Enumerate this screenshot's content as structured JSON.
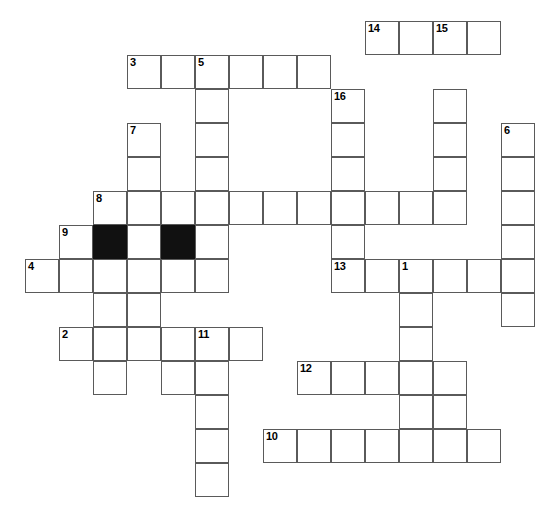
{
  "puzzle": {
    "title": "Crossword Puzzle Grid",
    "type": "crossword-grid",
    "geometry": {
      "cell_size": 34,
      "origin_x": 25,
      "origin_y": 21,
      "columns": 15,
      "rows": 14,
      "width": 555,
      "height": 505
    },
    "colors": {
      "background": "#ffffff",
      "cell_fill": "#ffffff",
      "cell_border": "#5a5a5a",
      "block_fill": "#111111",
      "number_color": "#000000"
    },
    "counts": {
      "open_cells": 97,
      "block_cells": 2,
      "numbered_clues": 16
    },
    "cells": [
      {
        "col": 10,
        "row": 0,
        "number": "14"
      },
      {
        "col": 11,
        "row": 0,
        "number": ""
      },
      {
        "col": 12,
        "row": 0,
        "number": "15"
      },
      {
        "col": 13,
        "row": 0,
        "number": ""
      },
      {
        "col": 3,
        "row": 1,
        "number": "3"
      },
      {
        "col": 4,
        "row": 1,
        "number": ""
      },
      {
        "col": 5,
        "row": 1,
        "number": "5"
      },
      {
        "col": 6,
        "row": 1,
        "number": ""
      },
      {
        "col": 7,
        "row": 1,
        "number": ""
      },
      {
        "col": 8,
        "row": 1,
        "number": ""
      },
      {
        "col": 9,
        "row": 2,
        "number": "16"
      },
      {
        "col": 5,
        "row": 2,
        "number": ""
      },
      {
        "col": 12,
        "row": 2,
        "number": ""
      },
      {
        "col": 3,
        "row": 3,
        "number": "7"
      },
      {
        "col": 5,
        "row": 3,
        "number": ""
      },
      {
        "col": 9,
        "row": 3,
        "number": ""
      },
      {
        "col": 12,
        "row": 3,
        "number": ""
      },
      {
        "col": 14,
        "row": 3,
        "number": "6"
      },
      {
        "col": 3,
        "row": 4,
        "number": ""
      },
      {
        "col": 5,
        "row": 4,
        "number": ""
      },
      {
        "col": 9,
        "row": 4,
        "number": ""
      },
      {
        "col": 12,
        "row": 4,
        "number": ""
      },
      {
        "col": 14,
        "row": 4,
        "number": ""
      },
      {
        "col": 2,
        "row": 5,
        "number": "8"
      },
      {
        "col": 3,
        "row": 5,
        "number": ""
      },
      {
        "col": 4,
        "row": 5,
        "number": ""
      },
      {
        "col": 5,
        "row": 5,
        "number": ""
      },
      {
        "col": 6,
        "row": 5,
        "number": ""
      },
      {
        "col": 7,
        "row": 5,
        "number": ""
      },
      {
        "col": 8,
        "row": 5,
        "number": ""
      },
      {
        "col": 9,
        "row": 5,
        "number": ""
      },
      {
        "col": 10,
        "row": 5,
        "number": ""
      },
      {
        "col": 11,
        "row": 5,
        "number": ""
      },
      {
        "col": 12,
        "row": 5,
        "number": ""
      },
      {
        "col": 14,
        "row": 5,
        "number": ""
      },
      {
        "col": 1,
        "row": 6,
        "number": "9"
      },
      {
        "col": 2,
        "row": 6,
        "number": "",
        "block": true
      },
      {
        "col": 3,
        "row": 6,
        "number": ""
      },
      {
        "col": 4,
        "row": 6,
        "number": "",
        "block": true
      },
      {
        "col": 5,
        "row": 6,
        "number": ""
      },
      {
        "col": 9,
        "row": 6,
        "number": ""
      },
      {
        "col": 14,
        "row": 6,
        "number": ""
      },
      {
        "col": 0,
        "row": 7,
        "number": "4"
      },
      {
        "col": 1,
        "row": 7,
        "number": ""
      },
      {
        "col": 2,
        "row": 7,
        "number": ""
      },
      {
        "col": 3,
        "row": 7,
        "number": ""
      },
      {
        "col": 4,
        "row": 7,
        "number": ""
      },
      {
        "col": 5,
        "row": 7,
        "number": ""
      },
      {
        "col": 9,
        "row": 7,
        "number": "13"
      },
      {
        "col": 10,
        "row": 7,
        "number": ""
      },
      {
        "col": 11,
        "row": 7,
        "number": "1"
      },
      {
        "col": 12,
        "row": 7,
        "number": ""
      },
      {
        "col": 13,
        "row": 7,
        "number": ""
      },
      {
        "col": 14,
        "row": 7,
        "number": ""
      },
      {
        "col": 2,
        "row": 8,
        "number": ""
      },
      {
        "col": 3,
        "row": 8,
        "number": ""
      },
      {
        "col": 11,
        "row": 8,
        "number": ""
      },
      {
        "col": 14,
        "row": 8,
        "number": ""
      },
      {
        "col": 1,
        "row": 9,
        "number": "2"
      },
      {
        "col": 2,
        "row": 9,
        "number": ""
      },
      {
        "col": 3,
        "row": 9,
        "number": ""
      },
      {
        "col": 4,
        "row": 9,
        "number": ""
      },
      {
        "col": 5,
        "row": 9,
        "number": "11"
      },
      {
        "col": 6,
        "row": 9,
        "number": ""
      },
      {
        "col": 11,
        "row": 9,
        "number": ""
      },
      {
        "col": 2,
        "row": 10,
        "number": ""
      },
      {
        "col": 4,
        "row": 10,
        "number": ""
      },
      {
        "col": 5,
        "row": 10,
        "number": ""
      },
      {
        "col": 8,
        "row": 10,
        "number": "12"
      },
      {
        "col": 9,
        "row": 10,
        "number": ""
      },
      {
        "col": 10,
        "row": 10,
        "number": ""
      },
      {
        "col": 11,
        "row": 10,
        "number": ""
      },
      {
        "col": 12,
        "row": 10,
        "number": ""
      },
      {
        "col": 5,
        "row": 11,
        "number": ""
      },
      {
        "col": 11,
        "row": 11,
        "number": ""
      },
      {
        "col": 12,
        "row": 11,
        "number": ""
      },
      {
        "col": 5,
        "row": 12,
        "number": ""
      },
      {
        "col": 7,
        "row": 12,
        "number": "10"
      },
      {
        "col": 8,
        "row": 12,
        "number": ""
      },
      {
        "col": 9,
        "row": 12,
        "number": ""
      },
      {
        "col": 10,
        "row": 12,
        "number": ""
      },
      {
        "col": 11,
        "row": 12,
        "number": ""
      },
      {
        "col": 12,
        "row": 12,
        "number": ""
      },
      {
        "col": 13,
        "row": 12,
        "number": ""
      },
      {
        "col": 5,
        "row": 13,
        "number": ""
      }
    ]
  }
}
